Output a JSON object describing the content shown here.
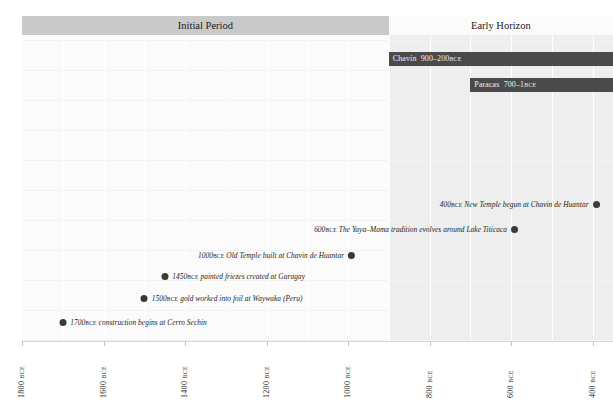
{
  "chart_data": {
    "type": "timeline",
    "title": "",
    "xlabel": "",
    "ylabel": "",
    "xlim": [
      1800,
      350
    ],
    "x_direction": "decreasing",
    "grid": true,
    "axis_ticks": [
      {
        "value": 1800,
        "number": "1800",
        "suffix": "BCE"
      },
      {
        "value": 1600,
        "number": "1600",
        "suffix": "BCE"
      },
      {
        "value": 1400,
        "number": "1400",
        "suffix": "BCE"
      },
      {
        "value": 1200,
        "number": "1200",
        "suffix": "BCE"
      },
      {
        "value": 1000,
        "number": "1000",
        "suffix": "BCE"
      },
      {
        "value": 800,
        "number": "800",
        "suffix": "BCE"
      },
      {
        "value": 600,
        "number": "600",
        "suffix": "BCE"
      },
      {
        "value": 400,
        "number": "400",
        "suffix": "BCE"
      }
    ],
    "eras": [
      {
        "label": "Initial Period",
        "start": 1800,
        "end": 900,
        "shade": "dark"
      },
      {
        "label": "Early Horizon",
        "start": 900,
        "end": 350,
        "shade": "light"
      }
    ],
    "cultures": [
      {
        "name": "Chavín",
        "range": "900–200",
        "suffix": "BCE",
        "start": 900,
        "end": 350,
        "row": 0
      },
      {
        "name": "Paracas",
        "range": "700–1",
        "suffix": "BCE",
        "start": 700,
        "end": 350,
        "row": 1
      }
    ],
    "events": [
      {
        "year": 1700,
        "number": "1700",
        "suffix": "BCE",
        "text": "construction begins at Cerro Sechin",
        "side": "right"
      },
      {
        "year": 1500,
        "number": "1500",
        "suffix": "BCE",
        "text": "gold worked into foil at Waywaka (Peru)",
        "side": "right"
      },
      {
        "year": 1450,
        "number": "1450",
        "suffix": "BCE",
        "text": "painted friezes created at Garagay",
        "side": "right"
      },
      {
        "year": 1000,
        "number": "1000",
        "suffix": "BCE",
        "text": "Old Temple built at Chavin de Huantar",
        "side": "left"
      },
      {
        "year": 600,
        "number": "600",
        "suffix": "BCE",
        "text": "The Yaya–Mama tradition evolves around Lake Titicaca",
        "side": "left"
      },
      {
        "year": 400,
        "number": "400",
        "suffix": "BCE",
        "text": "New Temple begun at Chavin de Huantar",
        "side": "left"
      }
    ],
    "colors": {
      "era_band_dark": "#c9c9c9",
      "era_band_light": "#fbfbfb",
      "culture_bar": "#4a4a4a",
      "culture_bar_text": "#f0f0f0",
      "event_dot": "#3a3a3a",
      "plot_background": "#fbfbfb",
      "era_shade": "#eeeeee",
      "gridline": "#ffffff",
      "axis_text": "#2a2a2a"
    }
  }
}
